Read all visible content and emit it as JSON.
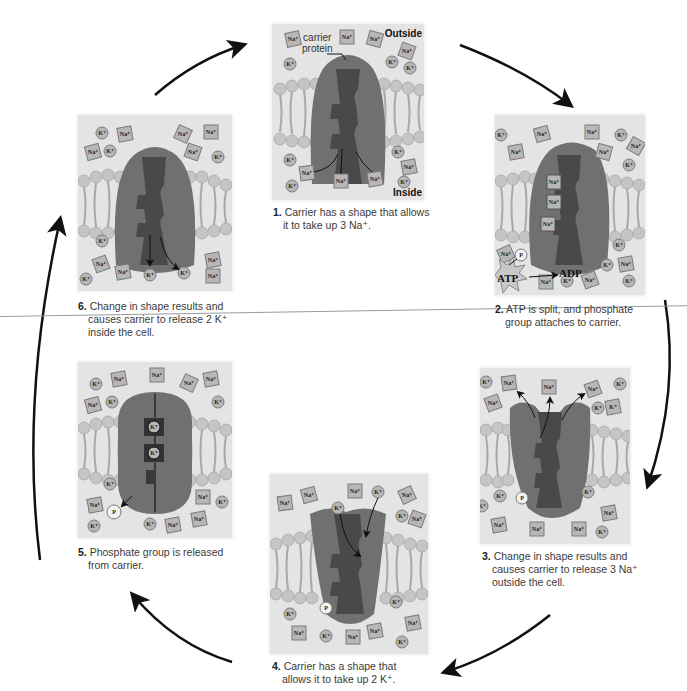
{
  "colors": {
    "background": "#ffffff",
    "panel_bg": "#e7e7e7",
    "protein_outer": "#6e6e6e",
    "protein_inner": "#4a4a4a",
    "arrow": "#111111",
    "ion_fill": "#b8b8b8"
  },
  "labels": {
    "outside": "Outside",
    "inside": "Inside",
    "carrier_protein_line1": "carrier",
    "carrier_protein_line2": "protein",
    "atp": "ATP",
    "adp": "ADP",
    "phosphate": "P",
    "na_ion": "Na⁺",
    "k_ion": "K⁺"
  },
  "steps": [
    {
      "number": "1.",
      "line1": "Carrier has a shape that allows",
      "line2": "it to take up 3 Na⁺.",
      "line3": ""
    },
    {
      "number": "2.",
      "line1": "ATP is split, and phosphate",
      "line2": "group attaches to carrier.",
      "line3": ""
    },
    {
      "number": "3.",
      "line1": "Change in shape results and",
      "line2": "causes carrier to release 3 Na⁺",
      "line3": "outside the cell."
    },
    {
      "number": "4.",
      "line1": "Carrier has a shape that",
      "line2": "allows it to take up 2 K⁺.",
      "line3": ""
    },
    {
      "number": "5.",
      "line1": "Phosphate group is released",
      "line2": "from carrier.",
      "line3": ""
    },
    {
      "number": "6.",
      "line1": "Change in shape results and",
      "line2": "causes carrier to release 2 K⁺",
      "line3": "inside the cell."
    }
  ],
  "cycle_arrows": [
    {
      "from": "6",
      "to": "1",
      "icon": "curved-arrow-icon"
    },
    {
      "from": "1",
      "to": "2",
      "icon": "curved-arrow-icon"
    },
    {
      "from": "2",
      "to": "3",
      "icon": "curved-arrow-icon"
    },
    {
      "from": "3",
      "to": "4",
      "icon": "curved-arrow-icon"
    },
    {
      "from": "4",
      "to": "5",
      "icon": "curved-arrow-icon"
    },
    {
      "from": "5",
      "to": "6",
      "icon": "curved-arrow-icon"
    }
  ]
}
